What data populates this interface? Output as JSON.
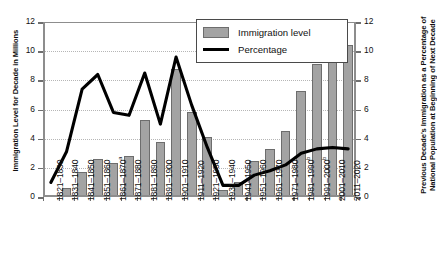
{
  "chart_data": {
    "type": "bar",
    "title": "",
    "xlabel": "",
    "ylabel": "Immigration Level for Decade in Millions",
    "y2label": "Previous Decade's Immigration as a Percentage of National Population at Beginning of Next Decade",
    "ylim": [
      0,
      12
    ],
    "y2lim": [
      0,
      12
    ],
    "yticks": [
      0,
      2,
      4,
      6,
      8,
      10,
      12
    ],
    "y2ticks": [
      0,
      2,
      4,
      6,
      8,
      10,
      12
    ],
    "grid": true,
    "legend_position": "top-right",
    "categories": [
      "1821–1830",
      "1831–1840",
      "1841–1850",
      "1851–1860",
      "1861–1870",
      "1871–1880",
      "1881–1890",
      "1891–1900",
      "1901–1910",
      "1911–1920",
      "1921–1930",
      "1931–1940",
      "1941–1950",
      "1951–1960",
      "1961–1970",
      "1971–1980",
      "1981–1990",
      "1991–2000",
      "2001–2010",
      "2011–2020"
    ],
    "category_footnotes": [
      "",
      "",
      "",
      "",
      "a",
      "",
      "",
      "",
      "",
      "",
      "",
      "",
      "",
      "",
      "",
      "",
      "b",
      "b",
      "",
      ""
    ],
    "series": [
      {
        "name": "Immigration level",
        "type": "bar",
        "axis": "left",
        "color": "#a3a3a3",
        "values": [
          0.1,
          0.6,
          1.7,
          2.6,
          2.3,
          2.8,
          5.3,
          3.8,
          8.8,
          5.8,
          4.1,
          0.5,
          1.0,
          2.5,
          3.3,
          4.5,
          7.3,
          9.1,
          10.5,
          10.4
        ]
      },
      {
        "name": "Percentage",
        "type": "line",
        "axis": "right",
        "color": "#000000",
        "values": [
          1.0,
          3.1,
          7.4,
          8.4,
          5.8,
          5.6,
          8.5,
          5.0,
          9.6,
          6.3,
          3.4,
          0.8,
          0.8,
          1.5,
          1.8,
          2.2,
          3.0,
          3.3,
          3.4,
          3.3
        ]
      }
    ]
  },
  "legend": {
    "items": [
      {
        "label": "Immigration level",
        "marker": "bar-swatch"
      },
      {
        "label": "Percentage",
        "marker": "line-swatch"
      }
    ]
  }
}
